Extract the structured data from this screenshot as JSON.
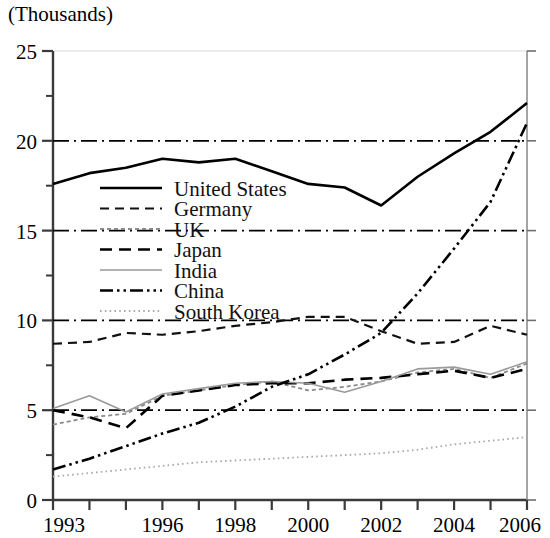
{
  "chart_data": {
    "type": "line",
    "title": "(Thousands)",
    "xlabel": "",
    "ylabel": "(Thousands)",
    "unit_note": "(Thousands)",
    "x": [
      1993,
      1994,
      1995,
      1996,
      1997,
      1998,
      1999,
      2000,
      2001,
      2002,
      2003,
      2004,
      2005,
      2006
    ],
    "xticklabels": [
      "1993",
      "",
      "",
      "1996",
      "",
      "1998",
      "",
      "2000",
      "",
      "2002",
      "",
      "2004",
      "",
      "2006"
    ],
    "xtick_values": [
      "1993",
      "1996",
      "1998",
      "2000",
      "2002",
      "2004",
      "2006"
    ],
    "yticklabels": [
      "0",
      "5",
      "10",
      "15",
      "20",
      "25"
    ],
    "ytick_values": [
      0,
      5,
      10,
      15,
      20,
      25
    ],
    "yminor_values": [
      2.5,
      7.5,
      12.5,
      17.5,
      22.5
    ],
    "xlim": [
      1993,
      2006
    ],
    "ylim": [
      0,
      25
    ],
    "grid": false,
    "legend_position": "upper-left-inside",
    "series": [
      {
        "name": "United States",
        "style": "solid",
        "color": "#000000",
        "width": 2.6,
        "values": [
          17.6,
          18.2,
          18.5,
          19.0,
          18.8,
          19.0,
          18.3,
          17.6,
          17.4,
          16.4,
          18.0,
          19.3,
          20.5,
          22.1
        ]
      },
      {
        "name": "Germany",
        "style": "dashed",
        "color": "#111111",
        "width": 2.2,
        "values": [
          8.7,
          8.8,
          9.3,
          9.2,
          9.4,
          9.7,
          9.9,
          10.2,
          10.2,
          9.4,
          8.7,
          8.8,
          9.7,
          9.2
        ]
      },
      {
        "name": "UK",
        "style": "fine-dashed",
        "color": "#8a8a8a",
        "width": 1.8,
        "values": [
          4.2,
          4.6,
          4.8,
          5.8,
          6.1,
          6.4,
          6.6,
          6.1,
          6.3,
          6.6,
          7.1,
          7.3,
          6.8,
          7.6
        ]
      },
      {
        "name": "Japan",
        "style": "long-dashed",
        "color": "#000000",
        "width": 2.6,
        "values": [
          5.0,
          4.6,
          4.0,
          5.8,
          6.1,
          6.4,
          6.5,
          6.5,
          6.7,
          6.8,
          7.0,
          7.2,
          6.8,
          7.3
        ]
      },
      {
        "name": "India",
        "style": "thin-solid",
        "color": "#9a9a9a",
        "width": 1.6,
        "values": [
          5.1,
          5.8,
          4.9,
          5.9,
          6.2,
          6.5,
          6.6,
          6.5,
          6.0,
          6.6,
          7.3,
          7.4,
          7.0,
          7.7
        ]
      },
      {
        "name": "China",
        "style": "dash-dot-dot",
        "color": "#000000",
        "width": 2.6,
        "values": [
          1.7,
          2.3,
          3.0,
          3.7,
          4.3,
          5.2,
          6.3,
          7.0,
          8.1,
          9.3,
          11.5,
          14.0,
          16.6,
          21.0
        ]
      },
      {
        "name": "South Korea",
        "style": "dotted",
        "color": "#aaaaaa",
        "width": 1.8,
        "values": [
          1.3,
          1.5,
          1.7,
          1.9,
          2.1,
          2.2,
          2.3,
          2.4,
          2.5,
          2.6,
          2.8,
          3.1,
          3.3,
          3.5
        ]
      }
    ],
    "reference_lines": [
      {
        "value": 20,
        "style": "dash-dot",
        "color": "#000000"
      },
      {
        "value": 15,
        "style": "dash-dot",
        "color": "#000000"
      },
      {
        "value": 10,
        "style": "dash-dot",
        "color": "#000000"
      },
      {
        "value": 5,
        "style": "dash-dot",
        "color": "#000000"
      }
    ],
    "legend": [
      {
        "label": "United States",
        "style": "solid"
      },
      {
        "label": "Germany",
        "style": "dashed"
      },
      {
        "label": "UK",
        "style": "fine-dashed"
      },
      {
        "label": "Japan",
        "style": "long-dashed"
      },
      {
        "label": "India",
        "style": "thin-solid"
      },
      {
        "label": "China",
        "style": "dash-dot-dot"
      },
      {
        "label": "South Korea",
        "style": "dotted"
      }
    ]
  }
}
